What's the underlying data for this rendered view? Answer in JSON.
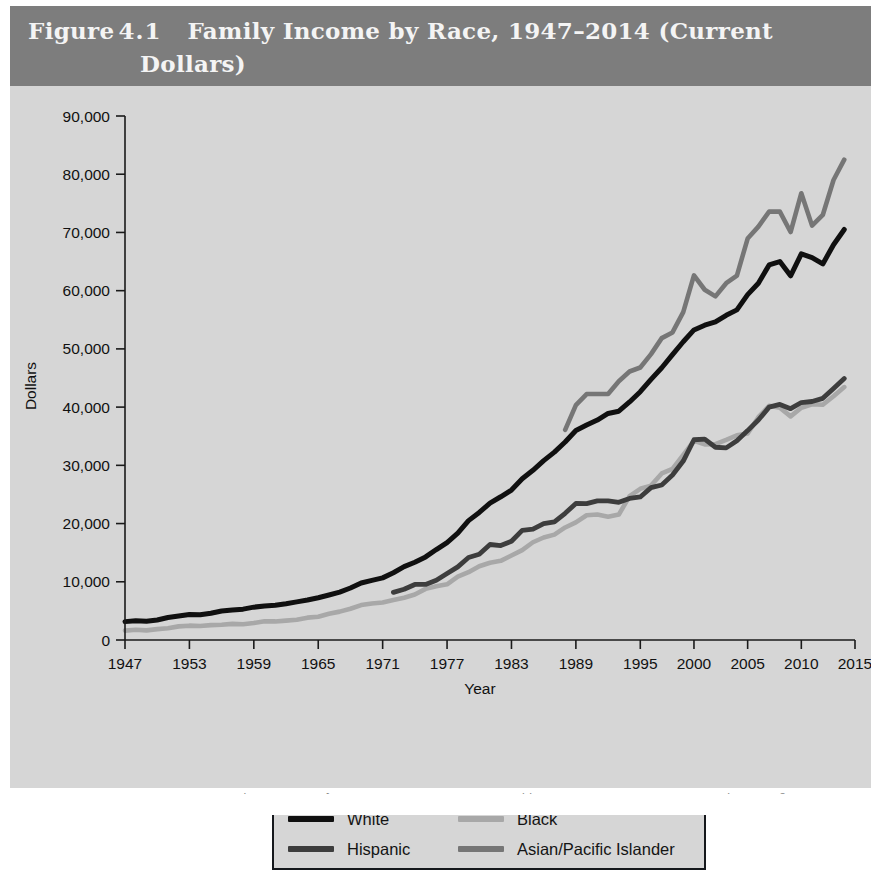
{
  "figure": {
    "label_prefix": "Figure",
    "number": "4.1",
    "title_line1": "Family Income by Race, 1947–2014 (Current",
    "title_line2": "Dollars)",
    "band_color": "#7d7d7d",
    "background_color": "#d6d6d6"
  },
  "legend": {
    "entries": [
      {
        "label": "White",
        "color": "#101010"
      },
      {
        "label": "Black",
        "color": "#a8a8a8"
      },
      {
        "label": "Hispanic",
        "color": "#3d3d3d"
      },
      {
        "label": "Asian/Pacific Islander",
        "color": "#767676"
      }
    ]
  },
  "axes": {
    "y_title": "Dollars",
    "x_title": "Year",
    "y_ticks": [
      "0",
      "10,000",
      "20,000",
      "30,000",
      "40,000",
      "50,000",
      "60,000",
      "70,000",
      "80,000",
      "90,000"
    ],
    "x_ticks": [
      "1947",
      "1953",
      "1959",
      "1965",
      "1971",
      "1977",
      "1983",
      "1989",
      "1995",
      "2000",
      "2005",
      "2010",
      "2015"
    ]
  },
  "caption": {
    "cut_off_text": "Source: U.S. Census Bureau, Current Population Survey, Annual Social and Economic Supplements, Table F-5. Race and Hispanic Origin of Householder — Families by Median and Mean Income"
  },
  "chart_data": {
    "type": "line",
    "title": "Family Income by Race, 1947–2014 (Current Dollars)",
    "xlabel": "Year",
    "ylabel": "Dollars",
    "xlim": [
      1947,
      2015
    ],
    "ylim": [
      0,
      90000
    ],
    "grid": false,
    "legend_position": "bottom",
    "x_tick_values": [
      1947,
      1953,
      1959,
      1965,
      1971,
      1977,
      1983,
      1989,
      1995,
      2000,
      2005,
      2010,
      2015
    ],
    "y_tick_values": [
      0,
      10000,
      20000,
      30000,
      40000,
      50000,
      60000,
      70000,
      80000,
      90000
    ],
    "series": [
      {
        "name": "White",
        "color": "#101010",
        "x": [
          1947,
          1948,
          1949,
          1950,
          1951,
          1952,
          1953,
          1954,
          1955,
          1956,
          1957,
          1958,
          1959,
          1960,
          1961,
          1962,
          1963,
          1964,
          1965,
          1966,
          1967,
          1968,
          1969,
          1970,
          1971,
          1972,
          1973,
          1974,
          1975,
          1976,
          1977,
          1978,
          1979,
          1980,
          1981,
          1982,
          1983,
          1984,
          1985,
          1986,
          1987,
          1988,
          1989,
          1990,
          1991,
          1992,
          1993,
          1994,
          1995,
          1996,
          1997,
          1998,
          1999,
          2000,
          2001,
          2002,
          2003,
          2004,
          2005,
          2006,
          2007,
          2008,
          2009,
          2010,
          2011,
          2012,
          2013,
          2014
        ],
        "values": [
          3157,
          3310,
          3232,
          3445,
          3859,
          4114,
          4392,
          4339,
          4605,
          4993,
          5166,
          5300,
          5643,
          5835,
          5980,
          6237,
          6548,
          6858,
          7251,
          7722,
          8234,
          8937,
          9794,
          10236,
          10672,
          11549,
          12595,
          13356,
          14268,
          15537,
          16740,
          18368,
          20502,
          21904,
          23517,
          24603,
          25757,
          27686,
          29152,
          30809,
          32274,
          34001,
          35975,
          36915,
          37783,
          38909,
          39300,
          40884,
          42646,
          44756,
          46754,
          49023,
          51224,
          53256,
          54067,
          54633,
          55768,
          56700,
          59317,
          61280,
          64427,
          65000,
          62545,
          66320,
          65689,
          64585,
          67892,
          70510
        ]
      },
      {
        "name": "Black",
        "color": "#a8a8a8",
        "x": [
          1947,
          1948,
          1949,
          1950,
          1951,
          1952,
          1953,
          1954,
          1955,
          1956,
          1957,
          1958,
          1959,
          1960,
          1961,
          1962,
          1963,
          1964,
          1965,
          1966,
          1967,
          1968,
          1969,
          1970,
          1971,
          1972,
          1973,
          1974,
          1975,
          1976,
          1977,
          1978,
          1979,
          1980,
          1981,
          1982,
          1983,
          1984,
          1985,
          1986,
          1987,
          1988,
          1989,
          1990,
          1991,
          1992,
          1993,
          1994,
          1995,
          1996,
          1997,
          1998,
          1999,
          2000,
          2001,
          2002,
          2003,
          2004,
          2005,
          2006,
          2007,
          2008,
          2009,
          2010,
          2011,
          2012,
          2013,
          2014
        ],
        "values": [
          1614,
          1768,
          1650,
          1869,
          2032,
          2338,
          2461,
          2410,
          2549,
          2628,
          2764,
          2711,
          2917,
          3233,
          3191,
          3330,
          3465,
          3839,
          3994,
          4507,
          4875,
          5360,
          5999,
          6279,
          6440,
          6864,
          7269,
          7808,
          8779,
          9242,
          9563,
          10879,
          11644,
          12674,
          13266,
          13598,
          14506,
          15432,
          16786,
          17604,
          18098,
          19329,
          20209,
          21423,
          21548,
          21161,
          21542,
          24698,
          25970,
          26522,
          28602,
          29404,
          31778,
          34192,
          33598,
          33634,
          34369,
          35158,
          35464,
          38269,
          40222,
          39879,
          38409,
          39900,
          40495,
          40397,
          41877,
          43439
        ]
      },
      {
        "name": "Hispanic",
        "color": "#3d3d3d",
        "x": [
          1972,
          1973,
          1974,
          1975,
          1976,
          1977,
          1978,
          1979,
          1980,
          1981,
          1982,
          1983,
          1984,
          1985,
          1986,
          1987,
          1988,
          1989,
          1990,
          1991,
          1992,
          1993,
          1994,
          1995,
          1996,
          1997,
          1998,
          1999,
          2000,
          2001,
          2002,
          2003,
          2004,
          2005,
          2006,
          2007,
          2008,
          2009,
          2010,
          2011,
          2012,
          2013,
          2014
        ],
        "values": [
          8183,
          8715,
          9540,
          9551,
          10259,
          11421,
          12566,
          14169,
          14716,
          16401,
          16227,
          16956,
          18833,
          19027,
          19995,
          20306,
          21769,
          23446,
          23431,
          23895,
          23901,
          23654,
          24318,
          24570,
          26179,
          26628,
          28330,
          30735,
          34397,
          34490,
          33103,
          32997,
          34241,
          35967,
          37781,
          40000,
          40466,
          39730,
          40785,
          40966,
          41508,
          43200,
          44905
        ]
      },
      {
        "name": "Asian/Pacific Islander",
        "color": "#767676",
        "x": [
          1988,
          1989,
          1990,
          1991,
          1992,
          1993,
          1994,
          1995,
          1996,
          1997,
          1998,
          1999,
          2000,
          2001,
          2002,
          2003,
          2004,
          2005,
          2006,
          2007,
          2008,
          2009,
          2010,
          2011,
          2012,
          2013,
          2014
        ],
        "values": [
          36102,
          40351,
          42246,
          42245,
          42255,
          44456,
          46122,
          46806,
          49105,
          51850,
          52826,
          56316,
          62617,
          60158,
          59018,
          61282,
          62600,
          68957,
          71000,
          73578,
          73578,
          70069,
          76736,
          71175,
          73000,
          79000,
          82500
        ]
      }
    ]
  }
}
